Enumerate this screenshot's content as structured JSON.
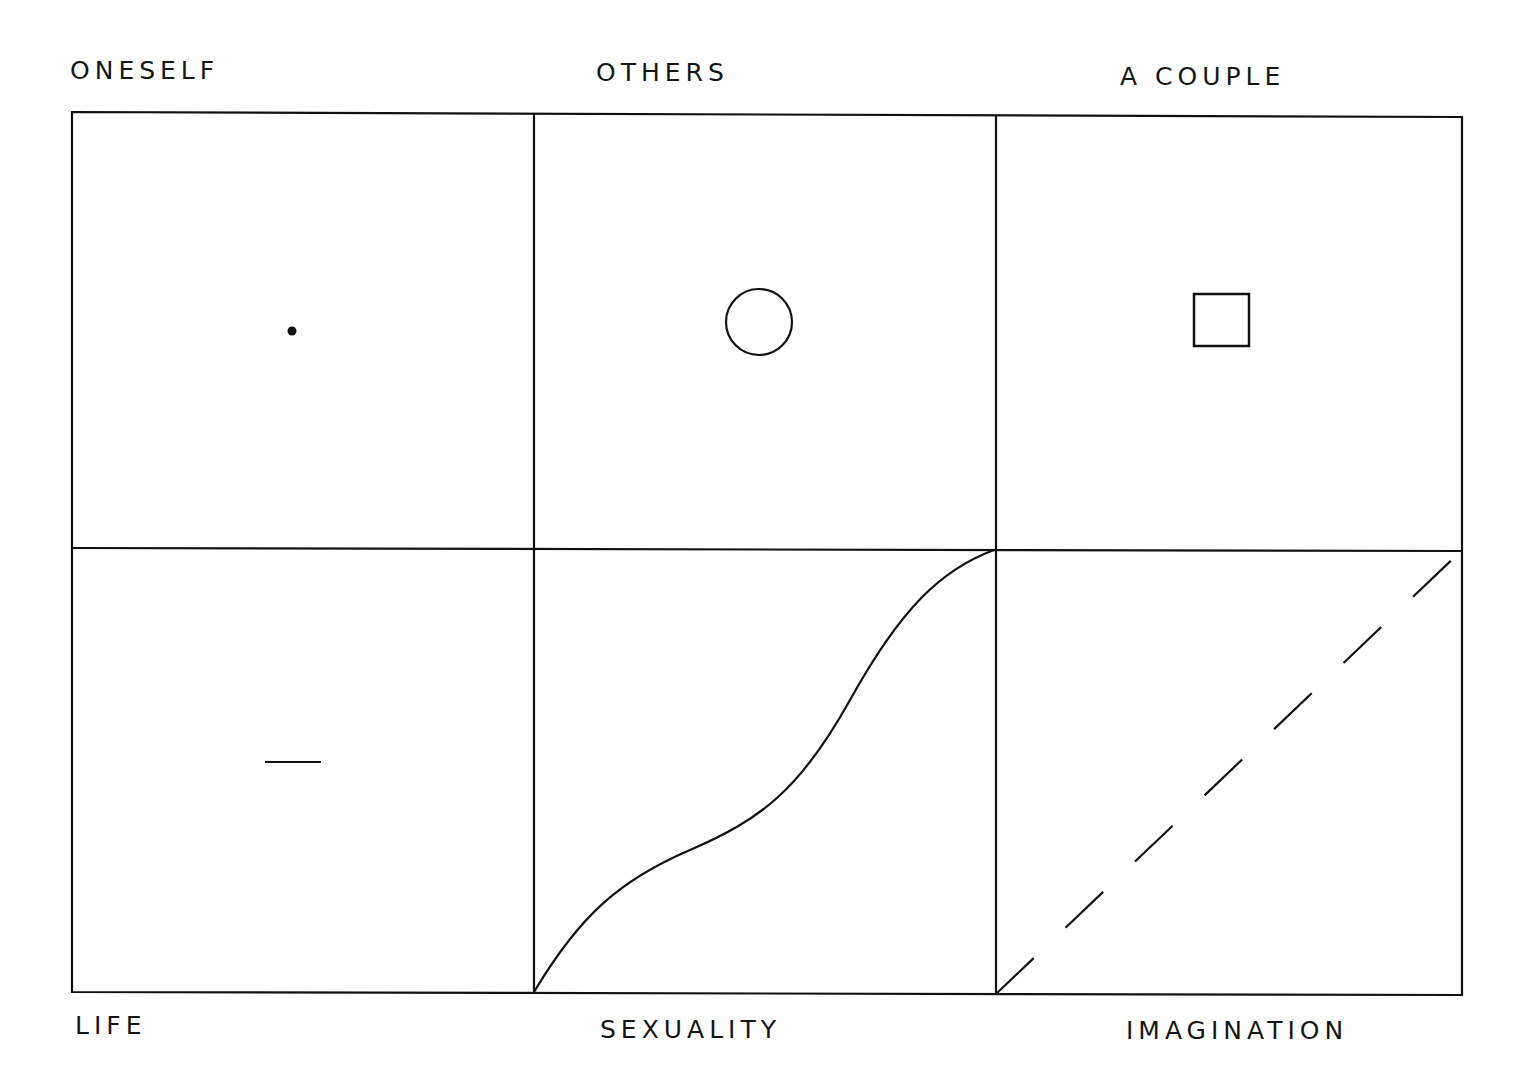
{
  "top_labels": [
    "ONESELF",
    "OTHERS",
    "A COUPLE"
  ],
  "bottom_labels": [
    "LIFE",
    "SEXUALITY",
    "IMAGINATION"
  ],
  "grid": {
    "columns": 3,
    "rows": 2,
    "cells": [
      {
        "row": 0,
        "col": 0,
        "symbol": "dot"
      },
      {
        "row": 0,
        "col": 1,
        "symbol": "circle"
      },
      {
        "row": 0,
        "col": 2,
        "symbol": "square"
      },
      {
        "row": 1,
        "col": 0,
        "symbol": "short-horizontal-line"
      },
      {
        "row": 1,
        "col": 1,
        "symbol": "s-curve-diagonal"
      },
      {
        "row": 1,
        "col": 2,
        "symbol": "dashed-diagonal-line"
      }
    ]
  },
  "colors": {
    "line": "#111111",
    "background": "#ffffff"
  }
}
